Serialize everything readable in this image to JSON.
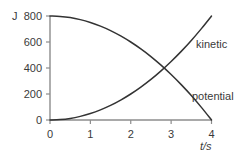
{
  "chart_data": {
    "type": "line",
    "title": "",
    "xlabel": "t/s",
    "ylabel": "",
    "yunit": "J",
    "xlim": [
      0,
      4
    ],
    "ylim": [
      0,
      800
    ],
    "grid": false,
    "legend_position": "inline-right",
    "xticks": [
      "0",
      "1",
      "2",
      "3",
      "4"
    ],
    "xtick_values": [
      0,
      1,
      2,
      3,
      4
    ],
    "yticks": [
      "0",
      "200",
      "400",
      "600",
      "800"
    ],
    "ytick_values": [
      0,
      200,
      400,
      600,
      800
    ],
    "x": [
      0,
      0.25,
      0.5,
      0.75,
      1,
      1.25,
      1.5,
      1.75,
      2,
      2.25,
      2.5,
      2.75,
      3,
      3.25,
      3.5,
      3.75,
      4
    ],
    "series": [
      {
        "name": "kinetic",
        "label": "kinetic",
        "color": "#333333",
        "values": [
          0,
          3,
          12,
          28,
          50,
          78,
          112,
          153,
          200,
          253,
          312,
          378,
          450,
          528,
          612,
          703,
          800
        ]
      },
      {
        "name": "potential",
        "label": "potential",
        "color": "#333333",
        "values": [
          800,
          797,
          788,
          772,
          750,
          722,
          688,
          647,
          600,
          547,
          488,
          422,
          350,
          272,
          188,
          97,
          0
        ]
      }
    ],
    "crossing_point": {
      "t": 2.83,
      "energy": 400
    },
    "axis_color": "#8c8c8c",
    "curve_color": "#333333",
    "background_color": "#ffffff"
  },
  "labels": {
    "kinetic": "kinetic",
    "potential": "potential",
    "x_axis_title": "t/s",
    "y_axis_unit": "J"
  }
}
